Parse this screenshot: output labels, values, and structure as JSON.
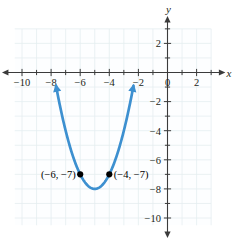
{
  "figure": {
    "background": "#ffffff",
    "curve_color": "#3d90d0",
    "axis_color": "#3b3b3b",
    "grid_color": "#e4eef0",
    "point_color": "#000000"
  },
  "axes": {
    "x_label": "x",
    "y_label": "y",
    "x_ticks": [
      {
        "value": -10,
        "label": "−10"
      },
      {
        "value": -8,
        "label": "−8"
      },
      {
        "value": -6,
        "label": "−6"
      },
      {
        "value": -4,
        "label": "−4"
      },
      {
        "value": -2,
        "label": "−2"
      },
      {
        "value": 0,
        "label": "0"
      },
      {
        "value": 2,
        "label": "2"
      }
    ],
    "y_ticks": [
      {
        "value": 2,
        "label": "2"
      },
      {
        "value": -2,
        "label": "−2"
      },
      {
        "value": -4,
        "label": "−4"
      },
      {
        "value": -6,
        "label": "−6"
      },
      {
        "value": -8,
        "label": "−8"
      },
      {
        "value": -10,
        "label": "−10"
      }
    ],
    "x_minor_ticks": [
      -9,
      -7,
      -5,
      -3,
      -1,
      1,
      3
    ],
    "y_minor_ticks": [
      3,
      1,
      -1,
      -3,
      -5,
      -7,
      -9
    ]
  },
  "annotations": {
    "left_point_label": "(−6, −7)",
    "right_point_label": "(−4, −7)"
  },
  "chart_data": {
    "type": "line",
    "title": "",
    "xlabel": "x",
    "ylabel": "y",
    "xlim": [
      -10.8,
      3.4
    ],
    "ylim": [
      -10.8,
      3.2
    ],
    "grid": true,
    "legend": "none",
    "curve": {
      "name": "parabola",
      "equation": "y = (x + 5)^2 - 8",
      "vertex": [
        -5,
        -8
      ],
      "domain": [
        -7.66,
        -2.34
      ],
      "arrows": [
        "left-end-up",
        "right-end-up"
      ],
      "color": "#3d90d0",
      "x": [
        -7.66,
        -7.4,
        -7.0,
        -6.6,
        -6.2,
        -6.0,
        -5.6,
        -5.2,
        -5.0,
        -4.8,
        -4.4,
        -4.0,
        -3.8,
        -3.4,
        -3.0,
        -2.6,
        -2.34
      ],
      "y": [
        -0.91,
        -2.24,
        -4.0,
        -5.44,
        -6.56,
        -7.0,
        -7.64,
        -7.96,
        -8.0,
        -7.96,
        -7.64,
        -7.0,
        -6.56,
        -5.44,
        -4.0,
        -2.24,
        -0.91
      ]
    },
    "points": [
      {
        "x": -6,
        "y": -7,
        "label": "(−6, −7)",
        "label_side": "left"
      },
      {
        "x": -4,
        "y": -7,
        "label": "(−4, −7)",
        "label_side": "right"
      }
    ]
  }
}
